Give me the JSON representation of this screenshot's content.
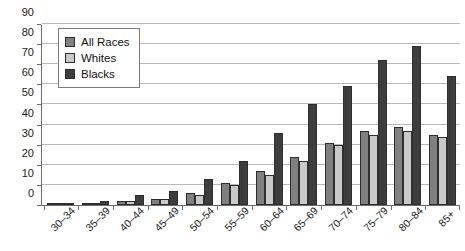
{
  "chart_data": {
    "type": "bar",
    "title": "",
    "subtitle": "",
    "xlabel": "",
    "ylabel": "",
    "ylim": [
      0,
      90
    ],
    "yticks": [
      0,
      10,
      20,
      30,
      40,
      50,
      60,
      70,
      80,
      90
    ],
    "grid": true,
    "legend_position": "top-left",
    "categories": [
      "30–34",
      "35–39",
      "40–44",
      "45–49",
      "50–54",
      "55–59",
      "60–64",
      "65–69",
      "70–74",
      "75–79",
      "80–84",
      "85+"
    ],
    "series": [
      {
        "name": "All Races",
        "color": "#808080",
        "values": [
          0.3,
          0.8,
          2,
          3,
          6,
          11,
          17,
          24,
          31,
          37,
          39,
          35
        ]
      },
      {
        "name": "Whites",
        "color": "#c9c9c9",
        "values": [
          0.3,
          0.7,
          2,
          3,
          5,
          10,
          15,
          22,
          30,
          35,
          37,
          34
        ]
      },
      {
        "name": "Blacks",
        "color": "#3d3d3d",
        "values": [
          0.5,
          2,
          5,
          7,
          13,
          22,
          36,
          50,
          59,
          72,
          79,
          64
        ]
      }
    ]
  },
  "legend": {
    "items": [
      {
        "label": "All Races"
      },
      {
        "label": "Whites"
      },
      {
        "label": "Blacks"
      }
    ]
  },
  "colors": {
    "all_races": "#808080",
    "whites": "#c9c9c9",
    "blacks": "#3d3d3d",
    "gridline": "#b9b9b9",
    "axis": "#6b6b6b",
    "background": "#ffffff"
  }
}
